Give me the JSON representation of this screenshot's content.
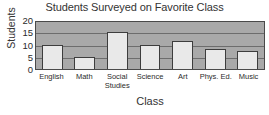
{
  "chart_data": {
    "type": "bar",
    "title": "Students Surveyed on Favorite Class",
    "xlabel": "Class",
    "ylabel": "Students",
    "categories": [
      "English",
      "Math",
      "Social Studies",
      "Science",
      "Art",
      "Phys. Ed.",
      "Music"
    ],
    "values": [
      10,
      5,
      15,
      10,
      11.5,
      8,
      7.5
    ],
    "ylim": [
      0,
      20
    ],
    "yticks": [
      0,
      5,
      10,
      15,
      20
    ],
    "ytick_labels": [
      "0",
      "5",
      "10",
      "15",
      "20"
    ],
    "grid": true,
    "grid_axis": "y",
    "legend": false,
    "colors": {
      "bar_fill": "#e9e9e9",
      "bar_border": "#3d3d3d",
      "plot_background": "#a9a9a9",
      "gridline": "#5a5a5a",
      "axis_border": "#4a4a4a",
      "text": "#2b2b2b",
      "page_background": "#ffffff"
    }
  }
}
